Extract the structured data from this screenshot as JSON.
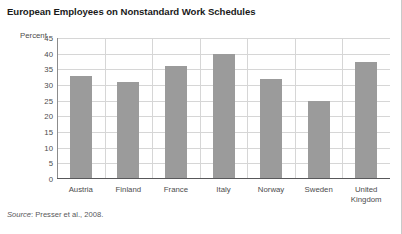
{
  "chart_data": {
    "type": "bar",
    "title": "European Employees on Nonstandard Work Schedules",
    "xlabel": "",
    "ylabel": "Percent",
    "ylim": [
      0,
      45
    ],
    "ytick_step": 5,
    "yticks": [
      "45",
      "40",
      "35",
      "30",
      "25",
      "20",
      "15",
      "10",
      "5",
      "0"
    ],
    "grid": "both",
    "legend": "none",
    "categories": [
      "Austria",
      "Finland",
      "France",
      "Italy",
      "Norway",
      "Sweden",
      "United\nKingdom"
    ],
    "values": [
      33,
      31,
      36,
      40,
      32,
      25,
      37.5
    ],
    "bar_color": "#9b9b9b",
    "gridline_color": "#d6d6d6",
    "axis_color": "#58585a"
  },
  "source": {
    "label": "Source",
    "separator": ": ",
    "text": "Presser et al., 2008."
  }
}
